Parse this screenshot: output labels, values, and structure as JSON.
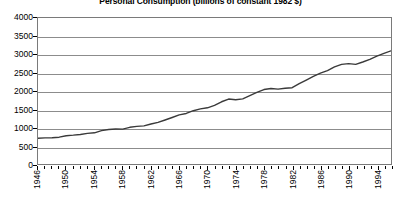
{
  "chart_data": {
    "type": "line",
    "title": "Personal Consumption (billions of constant 1982 $)",
    "xlabel": "",
    "ylabel": "",
    "ylim": [
      0,
      4000
    ],
    "ytick_step": 500,
    "ytick_labels": [
      "4000",
      "3500",
      "3000",
      "2500",
      "2000",
      "1500",
      "1000",
      "500",
      "0"
    ],
    "xlim": [
      1946,
      1996
    ],
    "xtick_step": 1,
    "xlabel_step": 4,
    "xtick_labels": [
      "1946",
      "1950",
      "1954",
      "1958",
      "1962",
      "1966",
      "1970",
      "1974",
      "1978",
      "1982",
      "1986",
      "1990",
      "1994"
    ],
    "grid": "horizontal",
    "legend": "none",
    "line_color": "#3a3a3a",
    "x": [
      1946,
      1947,
      1948,
      1949,
      1950,
      1951,
      1952,
      1953,
      1954,
      1955,
      1956,
      1957,
      1958,
      1959,
      1960,
      1961,
      1962,
      1963,
      1964,
      1965,
      1966,
      1967,
      1968,
      1969,
      1970,
      1971,
      1972,
      1973,
      1974,
      1975,
      1976,
      1977,
      1978,
      1979,
      1980,
      1981,
      1982,
      1983,
      1984,
      1985,
      1986,
      1987,
      1988,
      1989,
      1990,
      1991,
      1992,
      1993,
      1994,
      1995,
      1996
    ],
    "values": [
      705,
      715,
      720,
      735,
      775,
      790,
      810,
      840,
      855,
      915,
      945,
      960,
      955,
      1005,
      1030,
      1045,
      1095,
      1140,
      1205,
      1275,
      1345,
      1385,
      1460,
      1510,
      1540,
      1605,
      1705,
      1780,
      1760,
      1785,
      1875,
      1960,
      2040,
      2070,
      2050,
      2075,
      2090,
      2200,
      2300,
      2400,
      2490,
      2560,
      2660,
      2730,
      2750,
      2730,
      2795,
      2865,
      2955,
      3030,
      3100
    ],
    "notable_features": [
      {
        "label": "mid-1970s recession plateau",
        "years": [
          1973,
          1975
        ]
      },
      {
        "label": "early-1980s recession plateau",
        "years": [
          1979,
          1982
        ]
      }
    ]
  }
}
